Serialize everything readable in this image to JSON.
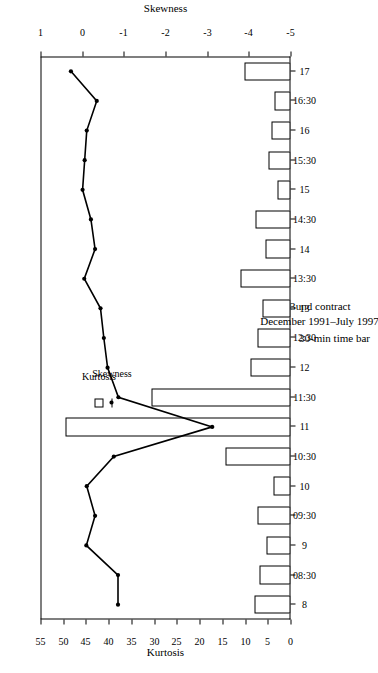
{
  "title": {
    "line1": "Bund contract",
    "line2": "December 1991–July 1997"
  },
  "legend": {
    "items": [
      {
        "label": "Kurtosis",
        "marker": "open-square",
        "color": "#000000"
      },
      {
        "label": "Skewness",
        "marker": "line-with-dot",
        "color": "#000000"
      }
    ]
  },
  "axes": {
    "x": {
      "title": "30-min time bar"
    },
    "y_left": {
      "title": "Kurtosis",
      "ticks": [
        "0",
        "5",
        "10",
        "15",
        "20",
        "25",
        "30",
        "35",
        "40",
        "45",
        "50",
        "55"
      ],
      "min": 0,
      "max": 55
    },
    "y_right": {
      "title": "Skewness",
      "ticks": [
        "1",
        "0",
        "-1",
        "-2",
        "-3",
        "-4",
        "-5"
      ],
      "min": -5,
      "max": 1
    }
  },
  "chart_data": {
    "type": "bar",
    "title": "Bund contract December 1991–July 1997",
    "xlabel": "30-min time bar",
    "ylabel": "Kurtosis",
    "y2label": "Skewness",
    "ylim": [
      0,
      55
    ],
    "y2lim": [
      -5,
      1
    ],
    "grid": false,
    "legend_position": "upper-right",
    "categories": [
      "8",
      "08:30",
      "9",
      "09:30",
      "10",
      "10:30",
      "11",
      "11:30",
      "12",
      "12:30",
      "13",
      "13:30",
      "14",
      "14:30",
      "15",
      "15:30",
      "16",
      "16:30",
      "17"
    ],
    "series": [
      {
        "name": "Kurtosis",
        "type": "bar",
        "axis": "left",
        "values": [
          8.0,
          6.8,
          5.2,
          7.2,
          3.8,
          14.3,
          49.4,
          30.5,
          8.8,
          7.2,
          6.1,
          11.1,
          5.5,
          7.6,
          2.9,
          4.9,
          4.2,
          3.6,
          10.1
        ]
      },
      {
        "name": "Skewness",
        "type": "line",
        "axis": "right",
        "values": [
          -0.86,
          -0.86,
          -0.1,
          -0.31,
          -0.11,
          -0.76,
          -3.12,
          -0.87,
          -0.61,
          -0.52,
          -0.44,
          -0.05,
          -0.31,
          -0.21,
          -0.01,
          -0.06,
          -0.11,
          -0.35,
          0.27
        ]
      }
    ]
  }
}
